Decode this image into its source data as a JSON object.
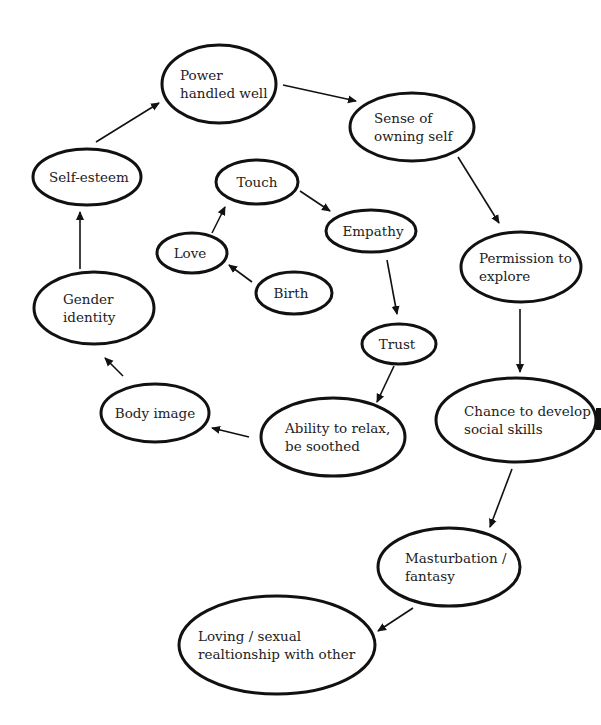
{
  "diagram": {
    "type": "flow-cycle",
    "nodes": [
      {
        "id": "power",
        "lines": [
          "Power",
          "handled well"
        ],
        "cx": 219,
        "cy": 84,
        "rx": 57,
        "ry": 39,
        "align": "start",
        "tx": 180
      },
      {
        "id": "sense",
        "lines": [
          "Sense of",
          "owning self"
        ],
        "cx": 412,
        "cy": 127,
        "rx": 62,
        "ry": 34,
        "align": "start",
        "tx": 374
      },
      {
        "id": "selfesteem",
        "lines": [
          "Self-esteem"
        ],
        "cx": 87,
        "cy": 177,
        "rx": 54,
        "ry": 28,
        "align": "middle",
        "tx": 89
      },
      {
        "id": "touch",
        "lines": [
          "Touch"
        ],
        "cx": 257,
        "cy": 182,
        "rx": 41,
        "ry": 22,
        "align": "middle",
        "tx": 257
      },
      {
        "id": "empathy",
        "lines": [
          "Empathy"
        ],
        "cx": 371,
        "cy": 231,
        "rx": 45,
        "ry": 21,
        "align": "middle",
        "tx": 373
      },
      {
        "id": "permission",
        "lines": [
          "Permission to",
          "explore"
        ],
        "cx": 521,
        "cy": 267,
        "rx": 60,
        "ry": 35,
        "align": "start",
        "tx": 479
      },
      {
        "id": "love",
        "lines": [
          "Love"
        ],
        "cx": 192,
        "cy": 253,
        "rx": 35,
        "ry": 20,
        "align": "middle",
        "tx": 190
      },
      {
        "id": "birth",
        "lines": [
          "Birth"
        ],
        "cx": 294,
        "cy": 293,
        "rx": 38,
        "ry": 21,
        "align": "middle",
        "tx": 291
      },
      {
        "id": "gender",
        "lines": [
          "Gender",
          "identity"
        ],
        "cx": 94,
        "cy": 308,
        "rx": 60,
        "ry": 36,
        "align": "start",
        "tx": 63
      },
      {
        "id": "trust",
        "lines": [
          "Trust"
        ],
        "cx": 399,
        "cy": 344,
        "rx": 37,
        "ry": 20,
        "align": "middle",
        "tx": 397
      },
      {
        "id": "bodyimage",
        "lines": [
          "Body image"
        ],
        "cx": 155,
        "cy": 413,
        "rx": 54,
        "ry": 29,
        "align": "middle",
        "tx": 155
      },
      {
        "id": "relax",
        "lines": [
          "Ability to relax,",
          "be soothed"
        ],
        "cx": 333,
        "cy": 437,
        "rx": 72,
        "ry": 39,
        "align": "start",
        "tx": 285
      },
      {
        "id": "social",
        "lines": [
          "Chance to develop",
          "social skills"
        ],
        "cx": 516,
        "cy": 420,
        "rx": 80,
        "ry": 42,
        "align": "start",
        "tx": 464
      },
      {
        "id": "masturbation",
        "lines": [
          "Masturbation /",
          "fantasy"
        ],
        "cx": 449,
        "cy": 567,
        "rx": 71,
        "ry": 39,
        "align": "start",
        "tx": 405
      },
      {
        "id": "loving",
        "lines": [
          "Loving / sexual",
          "realtionship with other"
        ],
        "cx": 277,
        "cy": 645,
        "rx": 98,
        "ry": 49,
        "align": "start",
        "tx": 198
      }
    ],
    "edges": [
      {
        "from": "birth",
        "to": "love",
        "x1": 252,
        "y1": 282,
        "x2": 229,
        "y2": 265
      },
      {
        "from": "love",
        "to": "touch",
        "x1": 212,
        "y1": 233,
        "x2": 225,
        "y2": 207
      },
      {
        "from": "touch",
        "to": "empathy",
        "x1": 300,
        "y1": 191,
        "x2": 330,
        "y2": 211
      },
      {
        "from": "empathy",
        "to": "trust",
        "x1": 387,
        "y1": 260,
        "x2": 397,
        "y2": 314
      },
      {
        "from": "trust",
        "to": "relax",
        "x1": 394,
        "y1": 366,
        "x2": 377,
        "y2": 402
      },
      {
        "from": "relax",
        "to": "bodyimage",
        "x1": 249,
        "y1": 437,
        "x2": 212,
        "y2": 428
      },
      {
        "from": "bodyimage",
        "to": "gender",
        "x1": 123,
        "y1": 376,
        "x2": 105,
        "y2": 358
      },
      {
        "from": "gender",
        "to": "selfesteem",
        "x1": 80,
        "y1": 269,
        "x2": 80,
        "y2": 212
      },
      {
        "from": "selfesteem",
        "to": "power",
        "x1": 96,
        "y1": 142,
        "x2": 159,
        "y2": 103
      },
      {
        "from": "power",
        "to": "sense",
        "x1": 283,
        "y1": 85,
        "x2": 356,
        "y2": 101
      },
      {
        "from": "sense",
        "to": "permission",
        "x1": 458,
        "y1": 157,
        "x2": 499,
        "y2": 223
      },
      {
        "from": "permission",
        "to": "social",
        "x1": 520,
        "y1": 309,
        "x2": 520,
        "y2": 372
      },
      {
        "from": "social",
        "to": "masturbation",
        "x1": 512,
        "y1": 469,
        "x2": 490,
        "y2": 527
      },
      {
        "from": "masturbation",
        "to": "loving",
        "x1": 413,
        "y1": 608,
        "x2": 378,
        "y2": 631
      }
    ]
  }
}
